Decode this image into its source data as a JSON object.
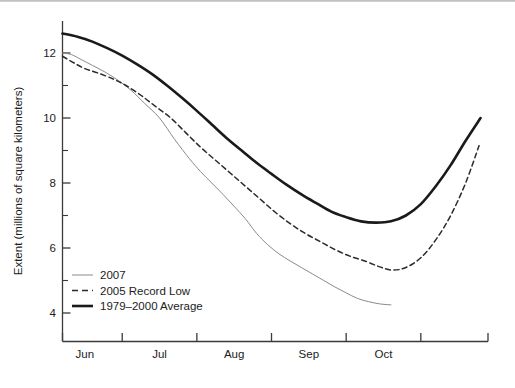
{
  "chart_data": {
    "type": "line",
    "title": "",
    "subtitle": "",
    "xlabel": "",
    "ylabel": "Extent (millions of square kilometers)",
    "x_tick_labels": [
      "Jun",
      "Jul",
      "Aug",
      "Sep",
      "Oct"
    ],
    "x_tick_positions_month_index": [
      5.5,
      6.5,
      7.5,
      8.5,
      9.5
    ],
    "x_axis_boundaries": [
      "May 22",
      "Jun 1",
      "Jul 1",
      "Aug 1",
      "Sep 1",
      "Oct 1",
      "Oct 31"
    ],
    "xlim": [
      5.2,
      10.9
    ],
    "y_tick_labels": [
      "4",
      "6",
      "8",
      "10",
      "12"
    ],
    "y_tick_values": [
      4,
      6,
      8,
      10,
      12
    ],
    "y_minor_tick_values": [
      3,
      5,
      7,
      9,
      11,
      13
    ],
    "ylim": [
      3.05,
      13.0
    ],
    "grid": false,
    "legend_position": "lower-left-inside",
    "legend_entries": [
      {
        "label": "2007",
        "style": "thin-solid",
        "color": "#8a8a8a",
        "width": 1.0
      },
      {
        "label": "2005 Record Low",
        "style": "dashed",
        "color": "#2b2b2b",
        "width": 1.4
      },
      {
        "label": "1979–2000 Average",
        "style": "thick-solid",
        "color": "#1a1a1a",
        "width": 2.6
      }
    ],
    "series": [
      {
        "name": "2007",
        "style": "thin-solid",
        "color": "#8a8a8a",
        "x": [
          5.2,
          5.32,
          5.45,
          5.6,
          5.78,
          5.95,
          6.12,
          6.3,
          6.5,
          6.7,
          6.9,
          7.05,
          7.2,
          7.35,
          7.5,
          7.65,
          7.8,
          7.95,
          8.1,
          8.25,
          8.4,
          8.55,
          8.7,
          8.85,
          9.0,
          9.15,
          9.3,
          9.45,
          9.6
        ],
        "y": [
          12.0,
          11.95,
          11.8,
          11.62,
          11.4,
          11.15,
          10.85,
          10.45,
          10.0,
          9.35,
          8.75,
          8.35,
          8.0,
          7.65,
          7.28,
          6.9,
          6.45,
          6.1,
          5.82,
          5.6,
          5.4,
          5.2,
          5.0,
          4.8,
          4.62,
          4.45,
          4.35,
          4.28,
          4.25
        ]
      },
      {
        "name": "2005 Record Low",
        "style": "dashed",
        "color": "#2b2b2b",
        "x": [
          5.2,
          5.35,
          5.5,
          5.68,
          5.88,
          6.05,
          6.25,
          6.45,
          6.65,
          6.85,
          7.05,
          7.25,
          7.45,
          7.65,
          7.85,
          8.05,
          8.25,
          8.45,
          8.65,
          8.85,
          9.05,
          9.25,
          9.45,
          9.62,
          9.8,
          10.0,
          10.2,
          10.4,
          10.6,
          10.78
        ],
        "y": [
          11.9,
          11.7,
          11.52,
          11.38,
          11.2,
          11.0,
          10.7,
          10.35,
          10.0,
          9.55,
          9.1,
          8.7,
          8.3,
          7.9,
          7.5,
          7.1,
          6.75,
          6.45,
          6.2,
          5.95,
          5.75,
          5.6,
          5.42,
          5.32,
          5.4,
          5.7,
          6.25,
          7.0,
          8.0,
          9.15
        ]
      },
      {
        "name": "1979–2000 Average",
        "style": "thick-solid",
        "color": "#1a1a1a",
        "x": [
          5.2,
          5.4,
          5.6,
          5.8,
          6.0,
          6.2,
          6.4,
          6.6,
          6.8,
          7.0,
          7.2,
          7.4,
          7.6,
          7.8,
          8.0,
          8.2,
          8.4,
          8.6,
          8.8,
          9.0,
          9.2,
          9.4,
          9.6,
          9.8,
          10.0,
          10.2,
          10.4,
          10.6,
          10.8
        ],
        "y": [
          12.6,
          12.5,
          12.35,
          12.15,
          11.92,
          11.65,
          11.35,
          11.0,
          10.62,
          10.22,
          9.8,
          9.38,
          9.0,
          8.62,
          8.28,
          7.95,
          7.65,
          7.38,
          7.12,
          6.95,
          6.82,
          6.78,
          6.82,
          7.0,
          7.35,
          7.9,
          8.55,
          9.3,
          10.0
        ]
      }
    ]
  },
  "axis": {
    "y_title": "Extent (millions of square kilometers)"
  }
}
